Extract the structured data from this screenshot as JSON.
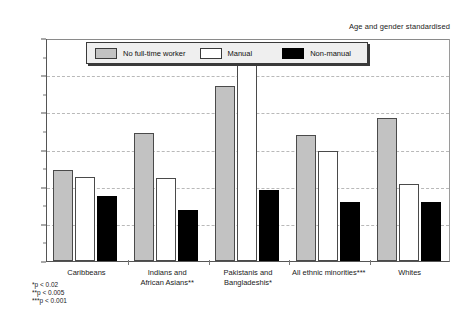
{
  "chart_data": {
    "type": "bar",
    "title": "",
    "subtitle": "",
    "annotation": "Age and gender standardised",
    "xlabel": "",
    "ylabel": "",
    "ylim": [
      0,
      30
    ],
    "ytick_step": 5,
    "yminor_step": 2.5,
    "grid": true,
    "value_suffix": "%",
    "legend_position": "top-center",
    "categories": [
      "Caribbeans",
      "Indians and African Asians**",
      "Pakistanis and Bangladeshis*",
      "All ethnic minorities***",
      "Whites"
    ],
    "category_lines": [
      [
        "Caribbeans"
      ],
      [
        "Indians and",
        "African Asians**"
      ],
      [
        "Pakistanis and",
        "Bangladeshis*"
      ],
      [
        "All ethnic minorities***"
      ],
      [
        "Whites"
      ]
    ],
    "ytick_labels": [
      "0%",
      "5%",
      "10%",
      "15%",
      "20%",
      "25%",
      "30%"
    ],
    "series": [
      {
        "name": "No full-time worker",
        "color": "#c2c2c2",
        "values": [
          12.3,
          17.2,
          23.5,
          17.0,
          19.3
        ]
      },
      {
        "name": "Manual",
        "color": "#ffffff",
        "values": [
          11.3,
          11.2,
          27.0,
          14.8,
          10.4
        ]
      },
      {
        "name": "Non-manual",
        "color": "#000000",
        "values": [
          8.7,
          6.8,
          9.6,
          7.9,
          8.0
        ]
      }
    ],
    "footnotes": [
      "*p < 0.02",
      "**p < 0.005",
      "***p < 0.001"
    ]
  }
}
